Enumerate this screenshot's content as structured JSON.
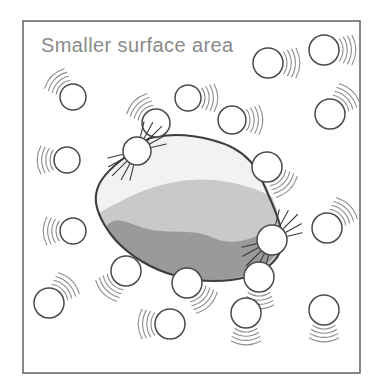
{
  "figure": {
    "caption": "Smaller surface area",
    "alt_description": "A large rock particle surrounded by small circular particles colliding with it",
    "colors": {
      "background": "#ffffff",
      "frame_stroke": "#555555",
      "caption_text": "#8a8a8a",
      "particle_stroke": "#4a4a4a",
      "particle_fill": "#ffffff",
      "motion_line": "#8d8d8d",
      "impact_ray": "#3a3a3a",
      "rock_outline": "#3d3d3d",
      "rock_top_band": "#f2f2f2",
      "rock_middle_band": "#c9c9c9",
      "rock_bottom_band": "#9a9a9a"
    },
    "frame": {
      "x": 23,
      "y": 21,
      "width": 337,
      "height": 352
    },
    "caption_position": {
      "x": 41,
      "y": 52
    },
    "rock": {
      "label": "solid-lump",
      "outline_path": "M 150 138 C 142 142 133 150 124 158 C 112 167 100 178 97 190 C 94 200 97 212 104 224 C 112 238 126 252 143 262 C 163 274 189 281 214 281 C 238 281 258 275 270 265 C 281 256 284 243 281 230 C 279 218 273 206 268 194 C 263 182 258 170 250 161 C 241 151 228 144 212 140 C 193 135 171 133 150 138 Z",
      "top_band_path": "M 150 138 C 142 142 133 150 124 158 C 112 167 100 178 97 190 C 94 197 95 205 99 213 C 112 206 126 198 141 192 C 158 185 176 181 193 180 C 210 179 226 181 241 185 C 253 188 263 192 272 197 C 268 188 263 178 257 170 C 249 158 236 147 218 141 C 198 134 172 133 150 138 Z",
      "middle_band_path": "M 99 213 C 103 224 110 236 120 246 C 133 258 150 268 170 274 C 190 280 212 282 230 279 C 248 276 263 269 272 259 C 280 249 282 237 280 226 C 279 216 276 206 272 197 C 263 192 253 188 241 185 C 226 181 210 179 193 180 C 176 181 158 185 141 192 C 126 198 112 206 99 213 Z",
      "bottom_band_path": "M 106 228 C 114 212 131 226 152 230 C 173 234 192 228 214 238 C 232 246 250 240 265 232 C 274 227 279 222 281 227 C 283 238 280 250 272 259 C 263 269 248 276 230 279 C 212 282 190 280 170 274 C 150 268 133 258 120 246 C 114 241 109 235 106 228 Z"
    },
    "particles": [
      {
        "id": "p1",
        "cx": 73,
        "cy": 97,
        "r": 13,
        "motion_dir": "up-left"
      },
      {
        "id": "p2",
        "cx": 188,
        "cy": 98,
        "r": 13,
        "motion_dir": "right"
      },
      {
        "id": "p3",
        "cx": 268,
        "cy": 63,
        "r": 15,
        "motion_dir": "right"
      },
      {
        "id": "p4",
        "cx": 324,
        "cy": 50,
        "r": 15,
        "motion_dir": "right"
      },
      {
        "id": "p5",
        "cx": 330,
        "cy": 114,
        "r": 15,
        "motion_dir": "up-right"
      },
      {
        "id": "p6",
        "cx": 156,
        "cy": 123,
        "r": 14,
        "motion_dir": "up-left"
      },
      {
        "id": "p7",
        "cx": 232,
        "cy": 120,
        "r": 14,
        "motion_dir": "right"
      },
      {
        "id": "p8",
        "cx": 67,
        "cy": 160,
        "r": 13,
        "motion_dir": "left"
      },
      {
        "id": "p9",
        "cx": 137,
        "cy": 151,
        "r": 14,
        "motion_dir": "impact",
        "impact_dir": "down-left"
      },
      {
        "id": "p10",
        "cx": 267,
        "cy": 167,
        "r": 15,
        "motion_dir": "down-right"
      },
      {
        "id": "p11",
        "cx": 73,
        "cy": 231,
        "r": 13,
        "motion_dir": "left"
      },
      {
        "id": "p12",
        "cx": 272,
        "cy": 240,
        "r": 15,
        "motion_dir": "impact",
        "impact_dir": "up-right"
      },
      {
        "id": "p13",
        "cx": 327,
        "cy": 228,
        "r": 15,
        "motion_dir": "up-right"
      },
      {
        "id": "p14",
        "cx": 126,
        "cy": 271,
        "r": 15,
        "motion_dir": "down-left"
      },
      {
        "id": "p15",
        "cx": 187,
        "cy": 283,
        "r": 15,
        "motion_dir": "down-right"
      },
      {
        "id": "p16",
        "cx": 259,
        "cy": 277,
        "r": 15,
        "motion_dir": "down"
      },
      {
        "id": "p17",
        "cx": 49,
        "cy": 303,
        "r": 15,
        "motion_dir": "up-right"
      },
      {
        "id": "p18",
        "cx": 170,
        "cy": 324,
        "r": 15,
        "motion_dir": "left"
      },
      {
        "id": "p19",
        "cx": 246,
        "cy": 313,
        "r": 15,
        "motion_dir": "down"
      },
      {
        "id": "p20",
        "cx": 324,
        "cy": 310,
        "r": 15,
        "motion_dir": "down"
      }
    ]
  }
}
